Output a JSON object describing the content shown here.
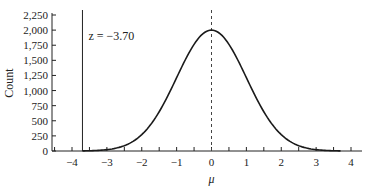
{
  "chart_data": {
    "type": "line",
    "title": "",
    "xlabel": "μ",
    "ylabel": "Count",
    "xlim": [
      -4.6,
      4.2
    ],
    "ylim": [
      0,
      2250
    ],
    "x_ticks": [
      -4,
      -3,
      -2,
      -1,
      0,
      1,
      2,
      3,
      4
    ],
    "x_tick_labels": [
      "−4",
      "−3",
      "−2",
      "−1",
      "0",
      "1",
      "2",
      "3",
      "4"
    ],
    "y_ticks": [
      0,
      250,
      500,
      750,
      1000,
      1250,
      1500,
      1750,
      2000,
      2250
    ],
    "y_tick_labels": [
      "0",
      "250",
      "500",
      "750",
      "1,000",
      "1,250",
      "1,500",
      "1,750",
      "2,000",
      "2,250"
    ],
    "grid": false,
    "series": [
      {
        "name": "distribution",
        "kind": "normal-curve",
        "mean": 0,
        "sd": 1,
        "peak": 2000,
        "x_range": [
          -3.7,
          3.7
        ]
      }
    ],
    "reference_lines": [
      {
        "x": 0,
        "style": "dashed"
      },
      {
        "x": -3.7,
        "style": "solid",
        "label": "z = −3.70"
      }
    ]
  }
}
